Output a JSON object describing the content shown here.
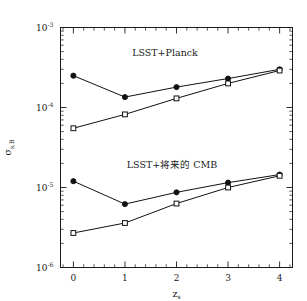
{
  "figure": {
    "background_color": "#ffffff",
    "foreground_color": "#1a1a1a",
    "width": 307,
    "height": 301
  },
  "annotations": {
    "upper_label": "LSST+Planck",
    "lower_label": "LSST+将来的 CMB"
  },
  "axes": {
    "x_title": "z",
    "x_title_sub": "s",
    "y_title_main": "σ",
    "y_title_sub": "s,B",
    "x_tick_labels": [
      "0",
      "1",
      "2",
      "3",
      "4"
    ],
    "y_tick_mantissa": "10",
    "y_tick_exponents": [
      "-3",
      "-4",
      "-5",
      "-6"
    ]
  },
  "chart_data": {
    "type": "line",
    "title": "",
    "xlabel": "z_s",
    "ylabel": "sigma_{s,B}",
    "xlim": [
      -0.25,
      4.25
    ],
    "ylim": [
      1e-06,
      0.001
    ],
    "yscale": "log",
    "xscale": "linear",
    "grid": false,
    "legend": "none",
    "x": [
      0,
      1,
      2,
      3,
      4
    ],
    "series": [
      {
        "name": "LSST+Planck (filled circles)",
        "group": "LSST+Planck",
        "marker": "filled-circle",
        "values": [
          0.00025,
          0.000135,
          0.00018,
          0.00023,
          0.0003
        ]
      },
      {
        "name": "LSST+Planck (open squares)",
        "group": "LSST+Planck",
        "marker": "open-square",
        "values": [
          5.5e-05,
          8.2e-05,
          0.00013,
          0.0002,
          0.00029
        ]
      },
      {
        "name": "LSST+future CMB (filled circles)",
        "group": "LSST+将来的 CMB",
        "marker": "filled-circle",
        "values": [
          1.2e-05,
          6.2e-06,
          8.7e-06,
          1.15e-05,
          1.45e-05
        ]
      },
      {
        "name": "LSST+future CMB (open squares)",
        "group": "LSST+将来的 CMB",
        "marker": "open-square",
        "values": [
          2.7e-06,
          3.6e-06,
          6.3e-06,
          1e-05,
          1.4e-05
        ]
      }
    ]
  }
}
